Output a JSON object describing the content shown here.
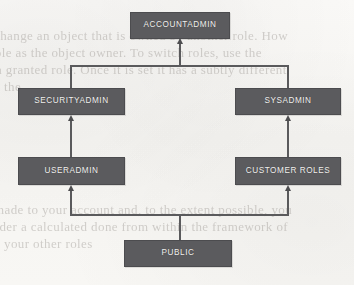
{
  "diagram": {
    "type": "hierarchy-flowchart",
    "colors": {
      "node_fill": "#5b5b5e",
      "node_border": "#4c4c4f",
      "node_text": "#f2f1ef",
      "connector": "#5a5a5c",
      "background": "#f7f6f3"
    },
    "nodes": [
      {
        "id": "accountadmin",
        "label": "ACCOUNTADMIN",
        "level": 0,
        "column": "center"
      },
      {
        "id": "securityadmin",
        "label": "SECURITYADMIN",
        "level": 1,
        "column": "left"
      },
      {
        "id": "sysadmin",
        "label": "SYSADMIN",
        "level": 1,
        "column": "right"
      },
      {
        "id": "useradmin",
        "label": "USERADMIN",
        "level": 2,
        "column": "left"
      },
      {
        "id": "customer_roles",
        "label": "CUSTOMER ROLES",
        "level": 2,
        "column": "right"
      },
      {
        "id": "public",
        "label": "PUBLIC",
        "level": 3,
        "column": "center"
      }
    ],
    "edges": [
      {
        "from": "securityadmin",
        "to": "accountadmin",
        "arrow": "up"
      },
      {
        "from": "sysadmin",
        "to": "accountadmin",
        "arrow": "up"
      },
      {
        "from": "useradmin",
        "to": "securityadmin",
        "arrow": "up"
      },
      {
        "from": "customer_roles",
        "to": "sysadmin",
        "arrow": "up"
      },
      {
        "from": "public",
        "to": "useradmin",
        "arrow": "up"
      },
      {
        "from": "public",
        "to": "customer_roles",
        "arrow": "up"
      }
    ]
  },
  "background_text": {
    "note": "faint illegible bleed-through from reverse side of scanned page",
    "lines": [
      {
        "text": "change an object that is owned by another role. How",
        "left": -6,
        "top": 28,
        "size": 13
      },
      {
        "text": "role as the object owner. To switch roles, use the",
        "left": -10,
        "top": 45,
        "size": 13
      },
      {
        "text": "a granted role. Once it is set it has a subtly different",
        "left": -4,
        "top": 62,
        "size": 13
      },
      {
        "text": "the",
        "left": 4,
        "top": 79,
        "size": 13
      },
      {
        "text": "made to your account and, to the extent possible, you",
        "left": -6,
        "top": 202,
        "size": 13
      },
      {
        "text": "sider a calculated done from within the framework of",
        "left": -10,
        "top": 219,
        "size": 13
      },
      {
        "text": "your other roles",
        "left": 4,
        "top": 236,
        "size": 13
      }
    ]
  }
}
